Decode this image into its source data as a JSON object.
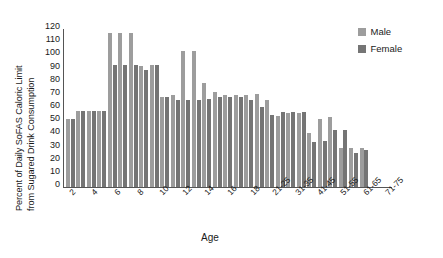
{
  "chart_data": {
    "type": "bar",
    "title": "",
    "xlabel": "Age",
    "ylabel": "Percent of Daily SoFAS Caloric Limit from Sugared Drink Consumption",
    "ylabel_line1": "Percent of Daily SoFAS Caloric Limit",
    "ylabel_line2": "from Sugared Drink Consumption",
    "ylim": [
      0,
      120
    ],
    "yticks": [
      120,
      110,
      100,
      90,
      80,
      70,
      60,
      50,
      40,
      30,
      20,
      10,
      0
    ],
    "grid": false,
    "legend_position": "top-right",
    "categories": [
      "2",
      "3",
      "4",
      "5",
      "6",
      "7",
      "8",
      "9",
      "10",
      "11",
      "12",
      "13",
      "14",
      "15",
      "16",
      "17",
      "18",
      "19-20",
      "21-25",
      "26-30",
      "31-35",
      "36-40",
      "41-45",
      "46-50",
      "51-55",
      "56-60",
      "61-65",
      "66-70",
      "71-75"
    ],
    "xtick_labels": [
      "2",
      "4",
      "6",
      "8",
      "10",
      "12",
      "14",
      "16",
      "18",
      "21-25",
      "31-35",
      "41-45",
      "51-55",
      "61-65",
      "71-75"
    ],
    "series": [
      {
        "name": "Male",
        "color": "#9d9d9d",
        "values": [
          52,
          58,
          58,
          58,
          117,
          117,
          117,
          92,
          93,
          68,
          70,
          103,
          103,
          79,
          72,
          70,
          70,
          70,
          71,
          66,
          54,
          56,
          56,
          41,
          52,
          53,
          30,
          30,
          30
        ]
      },
      {
        "name": "Female",
        "color": "#757575",
        "values": [
          52,
          58,
          58,
          58,
          93,
          93,
          93,
          89,
          93,
          68,
          66,
          66,
          66,
          67,
          68,
          68,
          68,
          66,
          61,
          55,
          57,
          57,
          57,
          34,
          35,
          43,
          43,
          26,
          28
        ]
      }
    ]
  },
  "legend": {
    "items": [
      {
        "label": "Male",
        "color": "#9d9d9d"
      },
      {
        "label": "Female",
        "color": "#757575"
      }
    ]
  }
}
